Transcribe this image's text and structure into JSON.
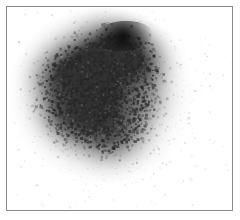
{
  "figure": {
    "kind": "grayscale-specimen-micrograph",
    "title": "",
    "caption": "",
    "background_color": "#ffffff",
    "frame": {
      "visible": true,
      "border_color": "#8a8a8a",
      "border_width_px": 1,
      "x": 6,
      "y": 6,
      "width": 227,
      "height": 205
    },
    "canvas": {
      "paper_color": "#ffffff",
      "ink_color": "#1a1a1a",
      "min_gray": "#0d0d0d",
      "max_gray": "#ffffff"
    }
  },
  "chart_data": {
    "type": "heatmap",
    "title": "",
    "subtitle": "",
    "xlabel": "",
    "ylabel": "",
    "grid": false,
    "legend": false,
    "colormap": "grayscale-inverted",
    "value_range": [
      0,
      1
    ],
    "blob": {
      "center_x": 95,
      "center_y": 88,
      "radius_x": 70,
      "radius_y": 66,
      "darkest_point": {
        "x": 116,
        "y": 29,
        "value": 0.97
      },
      "outline_points": [
        [
          88,
          16
        ],
        [
          112,
          15
        ],
        [
          134,
          19
        ],
        [
          150,
          28
        ],
        [
          157,
          44
        ],
        [
          160,
          62
        ],
        [
          156,
          82
        ],
        [
          150,
          104
        ],
        [
          141,
          124
        ],
        [
          128,
          141
        ],
        [
          112,
          150
        ],
        [
          94,
          152
        ],
        [
          78,
          146
        ],
        [
          64,
          134
        ],
        [
          52,
          120
        ],
        [
          40,
          104
        ],
        [
          31,
          86
        ],
        [
          27,
          68
        ],
        [
          31,
          51
        ],
        [
          42,
          38
        ],
        [
          57,
          28
        ],
        [
          72,
          20
        ]
      ]
    },
    "density_field": [
      {
        "x": 116,
        "y": 29,
        "radius": 26,
        "intensity": 0.97,
        "label": "dense-cap"
      },
      {
        "x": 94,
        "y": 33,
        "radius": 22,
        "intensity": 0.78,
        "label": "upper-core"
      },
      {
        "x": 138,
        "y": 36,
        "radius": 18,
        "intensity": 0.72,
        "label": "upper-right-lobe"
      },
      {
        "x": 38,
        "y": 68,
        "radius": 20,
        "intensity": 0.74,
        "label": "left-clump"
      },
      {
        "x": 58,
        "y": 50,
        "radius": 20,
        "intensity": 0.62,
        "label": "upper-left-shoulder"
      },
      {
        "x": 96,
        "y": 70,
        "radius": 30,
        "intensity": 0.55,
        "label": "mid-core"
      },
      {
        "x": 72,
        "y": 92,
        "radius": 26,
        "intensity": 0.58,
        "label": "mid-left"
      },
      {
        "x": 120,
        "y": 82,
        "radius": 24,
        "intensity": 0.52,
        "label": "mid-right"
      },
      {
        "x": 88,
        "y": 116,
        "radius": 26,
        "intensity": 0.62,
        "label": "lower-core"
      },
      {
        "x": 118,
        "y": 130,
        "radius": 22,
        "intensity": 0.58,
        "label": "lower-right-lobe"
      },
      {
        "x": 60,
        "y": 118,
        "radius": 20,
        "intensity": 0.44,
        "label": "lower-left"
      },
      {
        "x": 148,
        "y": 58,
        "radius": 16,
        "intensity": 0.4,
        "label": "right-fringe"
      },
      {
        "x": 100,
        "y": 148,
        "radius": 18,
        "intensity": 0.3,
        "label": "bottom-fringe"
      },
      {
        "x": 40,
        "y": 108,
        "radius": 16,
        "intensity": 0.26,
        "label": "left-fringe"
      },
      {
        "x": 150,
        "y": 96,
        "radius": 16,
        "intensity": 0.22,
        "label": "right-scatter"
      }
    ],
    "scatter_specks": {
      "count": 2600,
      "seed": 20240517,
      "size_px": [
        1,
        3
      ],
      "falloff": "gaussian",
      "spread_x": 78,
      "spread_y": 72
    }
  }
}
